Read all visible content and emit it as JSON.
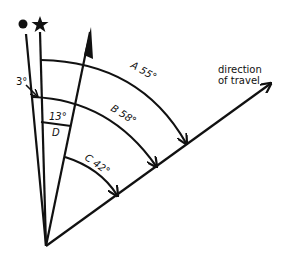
{
  "diagram": {
    "type": "navigation-angle-diagram",
    "symbols": {
      "dot": "filled-circle (true north / reference)",
      "star": "star (star bearing reference)"
    },
    "labels": {
      "direction": "direction",
      "of_travel": "of travel",
      "angle_a": "A 55°",
      "angle_b": "B 58°",
      "angle_c": "C 42°",
      "angle_d_value": "13°",
      "angle_d": "D",
      "small_angle": "3°"
    },
    "angles": [
      {
        "name": "A",
        "value_deg": 55,
        "from": "star line",
        "to": "direction of travel"
      },
      {
        "name": "B",
        "value_deg": 58,
        "from": "dot line",
        "to": "direction of travel"
      },
      {
        "name": "C",
        "value_deg": 42,
        "from": "arrow line",
        "to": "direction of travel"
      },
      {
        "name": "D",
        "value_deg": 13,
        "from": "star line",
        "to": "arrow line"
      },
      {
        "name": "offset",
        "value_deg": 3,
        "from": "dot line",
        "to": "star line"
      }
    ],
    "colors": {
      "stroke": "#111111",
      "background": "#ffffff"
    }
  }
}
